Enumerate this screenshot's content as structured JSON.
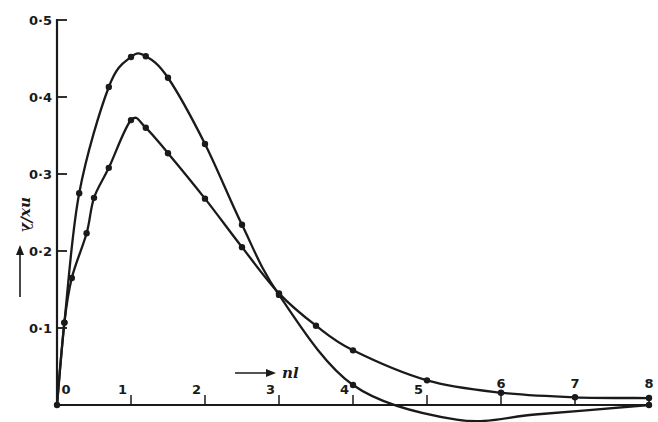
{
  "chart_data": {
    "type": "line",
    "title": "",
    "xlabel": "nl",
    "ylabel": "nx/λ",
    "xlim": [
      0,
      8
    ],
    "ylim": [
      0,
      0.5
    ],
    "x_ticks": [
      "0",
      "1",
      "2",
      "3",
      "4",
      "5",
      "6",
      "7",
      "8"
    ],
    "y_ticks": [
      "0·1",
      "0·2",
      "0·3",
      "0·4",
      "0·5"
    ],
    "grid": false,
    "legend": null,
    "series": [
      {
        "name": "upper curve (peak ≈ 0·45)",
        "x": [
          0,
          0.1,
          0.3,
          0.7,
          1.0,
          1.2,
          1.5,
          2.0,
          2.5,
          3.0,
          4.0,
          5.4,
          6.5,
          8.0
        ],
        "values": [
          0,
          0.107,
          0.275,
          0.413,
          0.452,
          0.453,
          0.425,
          0.339,
          0.234,
          0.143,
          0.026,
          -0.019,
          -0.012,
          0.0
        ],
        "markers": [
          true,
          true,
          true,
          true,
          true,
          true,
          true,
          true,
          true,
          true,
          true,
          false,
          false,
          true
        ]
      },
      {
        "name": "lower curve (peak ≈ 0·37)",
        "x": [
          0,
          0.1,
          0.2,
          0.4,
          0.5,
          0.7,
          1.0,
          1.2,
          1.5,
          2.0,
          2.5,
          3.0,
          3.5,
          4.0,
          5.0,
          6.0,
          7.0,
          8.0
        ],
        "values": [
          0,
          0.107,
          0.165,
          0.223,
          0.269,
          0.308,
          0.37,
          0.36,
          0.327,
          0.268,
          0.205,
          0.145,
          0.103,
          0.071,
          0.032,
          0.016,
          0.01,
          0.009
        ],
        "markers": [
          false,
          true,
          true,
          true,
          true,
          true,
          true,
          true,
          true,
          true,
          true,
          true,
          true,
          true,
          true,
          true,
          true,
          true
        ]
      }
    ],
    "annotations": [
      "→ nl (x-axis arrow label)",
      "↑ nx/λ (y-axis arrow label)"
    ]
  },
  "labels": {
    "x_axis": "nl",
    "y_axis": "nx/λ",
    "x_ticks": [
      "0",
      "1",
      "2",
      "3",
      "4",
      "5",
      "6",
      "7",
      "8"
    ],
    "y_ticks": [
      "0·1",
      "0·2",
      "0·3",
      "0·4",
      "0·5"
    ]
  }
}
